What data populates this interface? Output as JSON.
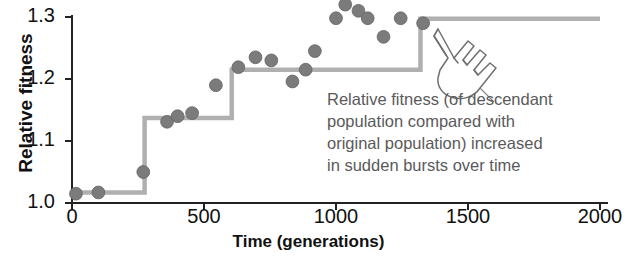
{
  "chart_data": {
    "type": "scatter",
    "title": "",
    "xlabel": "Time (generations)",
    "ylabel": "Relative fitness",
    "xlim": [
      0,
      2000
    ],
    "ylim": [
      1.0,
      1.3
    ],
    "xticks": [
      0,
      500,
      1000,
      1500,
      2000
    ],
    "xtick_labels": [
      "0",
      "500",
      "1000",
      "1500",
      "2000"
    ],
    "yticks": [
      1.0,
      1.1,
      1.2,
      1.3
    ],
    "ytick_labels": [
      "1.0",
      "1.1",
      "1.2",
      "1.3"
    ],
    "grid": false,
    "legend": null,
    "series": [
      {
        "name": "Observed relative fitness",
        "type": "scatter",
        "marker": "circle",
        "color": "#7b7b7b",
        "points": [
          {
            "x": 15,
            "y": 1.015
          },
          {
            "x": 100,
            "y": 1.017
          },
          {
            "x": 270,
            "y": 1.05
          },
          {
            "x": 360,
            "y": 1.131
          },
          {
            "x": 400,
            "y": 1.14
          },
          {
            "x": 455,
            "y": 1.145
          },
          {
            "x": 545,
            "y": 1.19
          },
          {
            "x": 630,
            "y": 1.219
          },
          {
            "x": 695,
            "y": 1.235
          },
          {
            "x": 755,
            "y": 1.23
          },
          {
            "x": 835,
            "y": 1.196
          },
          {
            "x": 885,
            "y": 1.215
          },
          {
            "x": 920,
            "y": 1.245
          },
          {
            "x": 1000,
            "y": 1.298
          },
          {
            "x": 1035,
            "y": 1.32
          },
          {
            "x": 1085,
            "y": 1.31
          },
          {
            "x": 1120,
            "y": 1.298
          },
          {
            "x": 1180,
            "y": 1.268
          },
          {
            "x": 1245,
            "y": 1.298
          },
          {
            "x": 1330,
            "y": 1.29
          }
        ]
      },
      {
        "name": "Step fit (sudden bursts)",
        "type": "step",
        "color": "#b0b0b0",
        "steps": [
          {
            "x_start": 0,
            "x_end": 275,
            "y": 1.017
          },
          {
            "x_start": 275,
            "x_end": 605,
            "y": 1.137
          },
          {
            "x_start": 605,
            "x_end": 1320,
            "y": 1.215
          },
          {
            "x_start": 1320,
            "x_end": 2000,
            "y": 1.297
          }
        ]
      }
    ],
    "annotation": "Relative fitness (of descendant\npopulation compared with\noriginal population) increased\nin sudden bursts over time"
  },
  "axes": {
    "y_label": "Relative fitness",
    "x_label": "Time (generations)"
  },
  "colors": {
    "marker": "#7b7b7b",
    "step_line": "#b0b0b0",
    "axis": "#222222",
    "annotation_text": "#5a5a5a",
    "label_text": "#111111"
  },
  "icons": {
    "pointer": "pointing-hand-icon"
  }
}
